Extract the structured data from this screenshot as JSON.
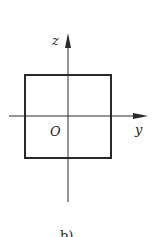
{
  "diagram": {
    "caption": "b)",
    "axes": {
      "vertical": {
        "label": "z"
      },
      "horizontal": {
        "label": "y"
      },
      "origin": {
        "label": "O"
      }
    },
    "shape": "square cross-section centered on axes",
    "colors": {
      "stroke": "#2a2a2a",
      "background": "#ffffff"
    }
  }
}
